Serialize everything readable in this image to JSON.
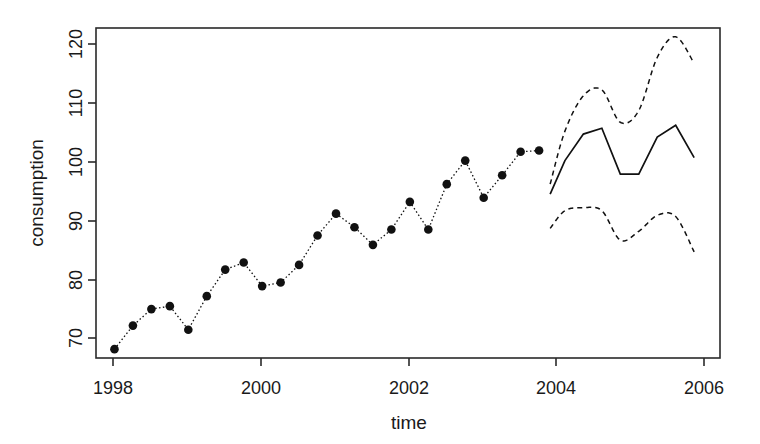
{
  "chart_data": {
    "type": "line",
    "title": "",
    "subtitle": "",
    "xlabel": "time",
    "ylabel": "consumption",
    "xlim": [
      1997.75,
      2006.2
    ],
    "ylim": [
      66,
      122
    ],
    "xticks": [
      1998,
      2000,
      2002,
      2004,
      2006
    ],
    "xtick_labels": [
      "1998",
      "2000",
      "2002",
      "2004",
      "2006"
    ],
    "yticks": [
      70,
      80,
      90,
      100,
      110,
      120
    ],
    "ytick_labels": [
      "70",
      "80",
      "90",
      "100",
      "110",
      "120"
    ],
    "grid": false,
    "legend": "none",
    "frame": "box",
    "annotations": [],
    "series": [
      {
        "name": "observed",
        "style": "points-dotted",
        "marker": "filled-circle",
        "color": "#111111",
        "x": [
          1998.0,
          1998.25,
          1998.5,
          1998.75,
          1999.0,
          1999.25,
          1999.5,
          1999.75,
          2000.0,
          2000.25,
          2000.5,
          2000.75,
          2001.0,
          2001.25,
          2001.5,
          2001.75,
          2002.0,
          2002.25,
          2002.5,
          2002.75,
          2003.0,
          2003.25,
          2003.5,
          2003.75
        ],
        "values": [
          67.5,
          71.5,
          74.3,
          74.8,
          70.8,
          76.5,
          81.0,
          82.2,
          78.2,
          78.8,
          81.8,
          86.8,
          90.5,
          88.2,
          85.2,
          87.8,
          92.5,
          87.8,
          95.5,
          99.5,
          93.2,
          97.0,
          101.0,
          101.2
        ]
      },
      {
        "name": "forecast",
        "style": "solid",
        "color": "#111111",
        "x": [
          2003.9,
          2004.1,
          2004.35,
          2004.6,
          2004.85,
          2005.1,
          2005.35,
          2005.6,
          2005.85
        ],
        "values": [
          93.8,
          99.5,
          104.0,
          105.0,
          97.2,
          97.2,
          103.5,
          105.5,
          100.0
        ]
      },
      {
        "name": "upper-prediction-interval",
        "style": "dashed",
        "color": "#111111",
        "x": [
          2003.9,
          2004.1,
          2004.35,
          2004.6,
          2004.85,
          2005.1,
          2005.35,
          2005.6,
          2005.85
        ],
        "values": [
          95.5,
          104.5,
          110.5,
          111.5,
          106.0,
          108.0,
          117.0,
          120.5,
          116.0
        ]
      },
      {
        "name": "lower-prediction-interval",
        "style": "dashed",
        "color": "#111111",
        "x": [
          2003.9,
          2004.1,
          2004.35,
          2004.6,
          2004.85,
          2005.1,
          2005.35,
          2005.6,
          2005.85
        ],
        "values": [
          88.0,
          91.0,
          91.5,
          91.0,
          86.0,
          87.5,
          90.2,
          90.0,
          84.0
        ]
      }
    ]
  },
  "axes": {
    "y_label": "consumption",
    "x_label": "time"
  }
}
